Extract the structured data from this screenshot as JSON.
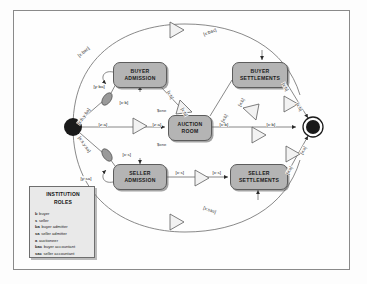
{
  "diagram": {
    "colors": {
      "scene_fill": "#b4b4b4",
      "scene_stroke": "#5c5c5c",
      "edge_stroke": "#6b6b6b",
      "node_fill": "#1a1a1a",
      "legend_fill": "#e9e9e9",
      "background": "#fefefe"
    },
    "nodes": [
      {
        "id": "initial",
        "label": "",
        "type": "initial-node",
        "x": 73,
        "y": 127
      },
      {
        "id": "buyer-admission",
        "label": "BUYER ADMISSION",
        "line1": "BUYER",
        "line2": "ADMISSION",
        "type": "scene",
        "x": 113,
        "y": 62,
        "w": 54,
        "h": 26
      },
      {
        "id": "auction-room",
        "label": "AUCTION ROOM",
        "line1": "AUCTION",
        "line2": "ROOM",
        "type": "scene",
        "x": 168,
        "y": 115,
        "w": 44,
        "h": 26
      },
      {
        "id": "buyer-settlements",
        "label": "BUYER SETTLEMENTS",
        "line1": "BUYER",
        "line2": "SETTLEMENTS",
        "type": "scene",
        "x": 232,
        "y": 62,
        "w": 56,
        "h": 26
      },
      {
        "id": "seller-admission",
        "label": "SELLER ADMISSION",
        "line1": "SELLER",
        "line2": "ADMISSION",
        "type": "scene",
        "x": 113,
        "y": 164,
        "w": 54,
        "h": 26
      },
      {
        "id": "seller-settlements",
        "label": "SELLER SETTLEMENTS",
        "line1": "SELLER",
        "line2": "SETTLEMENTS",
        "type": "scene",
        "x": 230,
        "y": 164,
        "w": 58,
        "h": 26
      },
      {
        "id": "final",
        "label": "",
        "type": "final-node",
        "x": 313,
        "y": 127
      }
    ],
    "transitions": [
      {
        "id": "t-init-buyer",
        "label": "[x:b,y:ba]"
      },
      {
        "id": "t-init-auction",
        "label": "[z:a]"
      },
      {
        "id": "t-init-seller",
        "label": "[x:s,y:sa]"
      },
      {
        "id": "t-buyer-loop",
        "label": "[y:ba]"
      },
      {
        "id": "t-buyer-out",
        "label": "[x:b]"
      },
      {
        "id": "t-buyer-auction",
        "label": "[x:b]"
      },
      {
        "id": "t-buyer-auction-2",
        "label": "[x:b]"
      },
      {
        "id": "t-auction-in",
        "label": "[z:a]"
      },
      {
        "id": "t-auction-out",
        "label": "[x:b]"
      },
      {
        "id": "t-auction-settle",
        "label": "[x:b]"
      },
      {
        "id": "t-settle-up",
        "label": "[x:b]"
      },
      {
        "id": "t-buyer-settle-in",
        "label": "[x:b]"
      },
      {
        "id": "t-buyer-settle-out",
        "label": "[x:b]"
      },
      {
        "id": "t-buyer-final",
        "label": "[x:b]"
      },
      {
        "id": "t-seller-loop",
        "label": "[y:sa]"
      },
      {
        "id": "t-seller-out",
        "label": "[x:s]"
      },
      {
        "id": "t-seller-mid",
        "label": "[x:s]"
      },
      {
        "id": "t-seller-mid-2",
        "label": "[x:s]"
      },
      {
        "id": "t-seller-settle",
        "label": "[x:s]"
      },
      {
        "id": "t-seller-final",
        "label": "[x:s]"
      },
      {
        "id": "t-bac-top-left",
        "label": "[x:bac]"
      },
      {
        "id": "t-bac-top-right",
        "label": "[x:bac]"
      },
      {
        "id": "t-sac-bottom-left",
        "label": "[x:sac]"
      },
      {
        "id": "t-sac-bottom-right",
        "label": "[x:sac]"
      }
    ],
    "annotations": [
      {
        "id": "auction-room-top",
        "label": "$one"
      },
      {
        "id": "auction-room-bottom",
        "label": "$one"
      }
    ]
  },
  "legend": {
    "title_line1": "INSTITUTION",
    "title_line2": "ROLES",
    "roles": [
      {
        "abbr": "b",
        "name": "buyer"
      },
      {
        "abbr": "s",
        "name": "seller"
      },
      {
        "abbr": "ba",
        "name": "buyer admitter"
      },
      {
        "abbr": "sa",
        "name": "seller admitter"
      },
      {
        "abbr": "a",
        "name": "auctioneer"
      },
      {
        "abbr": "bac",
        "name": "buyer accountant"
      },
      {
        "abbr": "sac",
        "name": "seller accountant"
      }
    ]
  }
}
